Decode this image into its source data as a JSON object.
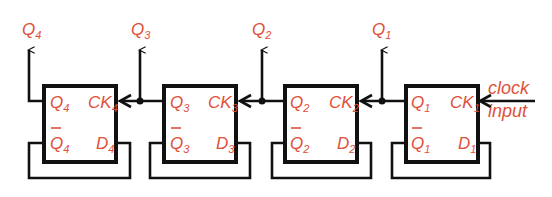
{
  "diagram": {
    "type": "4-bit ripple counter (D flip-flops, Q-bar fed back to D)",
    "colors": {
      "label": "#e0503a",
      "line": "#111111",
      "background": "#ffffff"
    },
    "outputs": [
      {
        "name": "Q",
        "sub": "4"
      },
      {
        "name": "Q",
        "sub": "3"
      },
      {
        "name": "Q",
        "sub": "2"
      },
      {
        "name": "Q",
        "sub": "1"
      }
    ],
    "flipflops": [
      {
        "id": "ff4",
        "q": "Q",
        "qbar": "Q",
        "ck": "CK",
        "d": "D",
        "sub": "4"
      },
      {
        "id": "ff3",
        "q": "Q",
        "qbar": "Q",
        "ck": "CK",
        "d": "D",
        "sub": "3"
      },
      {
        "id": "ff2",
        "q": "Q",
        "qbar": "Q",
        "ck": "CK",
        "d": "D",
        "sub": "2"
      },
      {
        "id": "ff1",
        "q": "Q",
        "qbar": "Q",
        "ck": "CK",
        "d": "D",
        "sub": "1"
      }
    ],
    "clock_label_line1": "clock",
    "clock_label_line2": "input"
  }
}
